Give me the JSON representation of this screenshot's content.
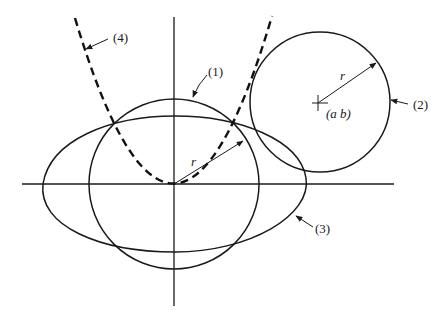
{
  "figure": {
    "axes": {
      "origin": [
        174,
        184
      ],
      "x_range": [
        22,
        394
      ],
      "y_range": [
        17,
        306
      ]
    },
    "curves": [
      {
        "id": "1",
        "label": "(1)",
        "type": "circle",
        "center": "origin",
        "radius_label": "r"
      },
      {
        "id": "2",
        "label": "(2)",
        "type": "circle",
        "center_label": "(a b)",
        "radius_label": "r"
      },
      {
        "id": "3",
        "label": "(3)",
        "type": "ellipse"
      },
      {
        "id": "4",
        "label": "(4)",
        "type": "parabola",
        "style": "dashed"
      }
    ],
    "labels": {
      "curve1": "(1)",
      "curve2": "(2)",
      "curve3": "(3)",
      "curve4": "(4)",
      "radius1": "r",
      "radius2": "r",
      "center2": "(a b)"
    },
    "colors": {
      "ink": "#1a1a1a",
      "background": "#ffffff"
    }
  }
}
